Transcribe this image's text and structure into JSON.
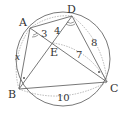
{
  "diagram": {
    "type": "geometry",
    "colors": {
      "stroke": "#555555",
      "dashed": "#888888",
      "text": "#333333",
      "background": "#ffffff"
    },
    "points": {
      "A": {
        "label": "A"
      },
      "B": {
        "label": "B"
      },
      "C": {
        "label": "C"
      },
      "D": {
        "label": "D"
      },
      "E": {
        "label": "E"
      }
    },
    "lengths": {
      "AE": "3",
      "DE": "4",
      "EC": "7",
      "DC": "8",
      "BC": "10",
      "AB": "x"
    },
    "angle_marks": {
      "A": "arc",
      "D": "arc",
      "B": "dot",
      "C": "dot"
    }
  }
}
